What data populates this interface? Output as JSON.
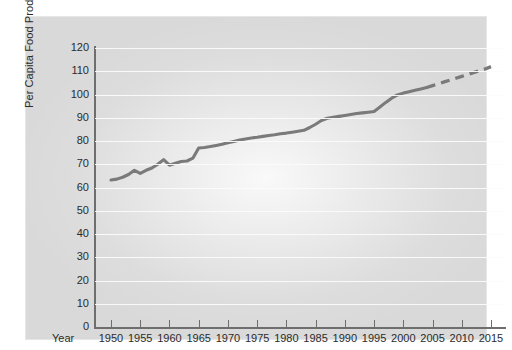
{
  "chart_data": {
    "type": "line",
    "title": "",
    "subtitle": "",
    "xlabel": "Year",
    "ylabel": "Per Capita Food Production",
    "xlim": [
      1948,
      2017
    ],
    "ylim": [
      0,
      120
    ],
    "grid": true,
    "legend": null,
    "y_ticks": [
      0,
      10,
      20,
      30,
      40,
      50,
      60,
      70,
      80,
      90,
      100,
      110,
      120
    ],
    "y_tick_labels": [
      "0",
      "10",
      "20",
      "30",
      "40",
      "50",
      "60",
      "70",
      "80",
      "90",
      "100",
      "110",
      "120"
    ],
    "x_ticks": [
      1950,
      1955,
      1960,
      1965,
      1970,
      1975,
      1980,
      1985,
      1990,
      1995,
      2000,
      2005,
      2010,
      2015
    ],
    "x_tick_labels": [
      "1950",
      "1955",
      "1960",
      "1965",
      "1970",
      "1975",
      "1980",
      "1985",
      "1990",
      "1995",
      "2000",
      "2005",
      "2010",
      "2015"
    ],
    "line_color": "#7a7a7a",
    "background_color": "#d9d9d9",
    "gridline_color": "#fbfbfb",
    "series": [
      {
        "name": "Per Capita Food Production (historical)",
        "style": "solid",
        "x": [
          1950,
          1951,
          1952,
          1953,
          1954,
          1955,
          1956,
          1957,
          1958,
          1959,
          1960,
          1961,
          1962,
          1963,
          1964,
          1965,
          1966,
          1967,
          1968,
          1969,
          1970,
          1971,
          1972,
          1973,
          1974,
          1975,
          1976,
          1977,
          1978,
          1979,
          1980,
          1981,
          1982,
          1983,
          1984,
          1985,
          1986,
          1987,
          1988,
          1989,
          1990,
          1991,
          1992,
          1993,
          1994,
          1995,
          1996,
          1997,
          1998,
          1999,
          2000,
          2001,
          2002,
          2003,
          2004
        ],
        "values": [
          63.2,
          63.6,
          64.4,
          65.6,
          67.4,
          66.1,
          67.4,
          68.4,
          70.0,
          72.0,
          69.6,
          70.4,
          71.2,
          71.4,
          72.6,
          77.0,
          77.2,
          77.6,
          78.1,
          78.6,
          79.2,
          79.8,
          80.4,
          80.9,
          81.3,
          81.6,
          82.0,
          82.4,
          82.7,
          83.1,
          83.4,
          83.8,
          84.2,
          84.6,
          85.8,
          87.2,
          88.8,
          89.8,
          90.2,
          90.6,
          91.0,
          91.4,
          91.8,
          92.1,
          92.4,
          92.7,
          94.6,
          96.6,
          98.4,
          99.8,
          100.6,
          101.2,
          101.8,
          102.4,
          103.0
        ]
      },
      {
        "name": "Per Capita Food Production (projected)",
        "style": "dashed",
        "x": [
          2004,
          2005,
          2006,
          2007,
          2008,
          2009,
          2010,
          2011,
          2012,
          2013,
          2014,
          2015
        ],
        "values": [
          103.0,
          103.8,
          104.6,
          105.4,
          106.2,
          107.0,
          107.8,
          108.6,
          109.4,
          110.2,
          111.0,
          112.0
        ]
      }
    ],
    "annotations": []
  }
}
